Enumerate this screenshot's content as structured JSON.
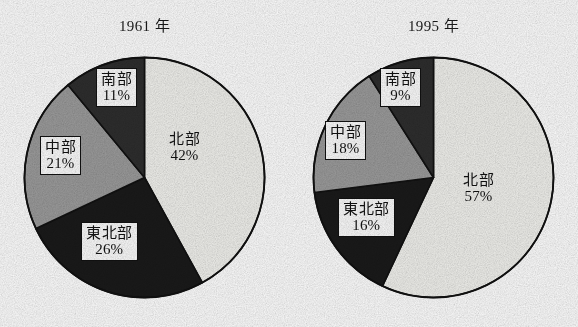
{
  "figure": {
    "background_color": "#ffffff",
    "outline_color": "#111111"
  },
  "palette": {
    "hokubu": "#f2f2ee",
    "tohokubu": "#1a1a1a",
    "chubu": "#9c9c9c",
    "nanbu": "#2e2e2e"
  },
  "charts": [
    {
      "title": "1961 年",
      "labels": {
        "hokubu": {
          "name": "北部",
          "pct": "42%",
          "boxed": false
        },
        "tohokubu": {
          "name": "東北部",
          "pct": "26%",
          "boxed": true
        },
        "chubu": {
          "name": "中部",
          "pct": "21%",
          "boxed": true
        },
        "nanbu": {
          "name": "南部",
          "pct": "11%",
          "boxed": true
        }
      }
    },
    {
      "title": "1995 年",
      "labels": {
        "hokubu": {
          "name": "北部",
          "pct": "57%",
          "boxed": false
        },
        "tohokubu": {
          "name": "東北部",
          "pct": "16%",
          "boxed": true
        },
        "chubu": {
          "name": "中部",
          "pct": "18%",
          "boxed": true
        },
        "nanbu": {
          "name": "南部",
          "pct": "9%",
          "boxed": true
        }
      }
    }
  ],
  "chart_data": [
    {
      "type": "pie",
      "title": "1961 年",
      "categories": [
        "北部",
        "東北部",
        "中部",
        "南部"
      ],
      "values": [
        42,
        26,
        21,
        11
      ],
      "value_unit": "%",
      "data_labels": [
        "42%",
        "26%",
        "21%",
        "11%"
      ],
      "colors": [
        "#f2f2ee",
        "#1a1a1a",
        "#9c9c9c",
        "#2e2e2e"
      ],
      "start_angle_deg": 0,
      "direction": "clockwise",
      "legend": "none",
      "labels_inside": true
    },
    {
      "type": "pie",
      "title": "1995 年",
      "categories": [
        "北部",
        "東北部",
        "中部",
        "南部"
      ],
      "values": [
        57,
        16,
        18,
        9
      ],
      "value_unit": "%",
      "data_labels": [
        "57%",
        "16%",
        "18%",
        "9%"
      ],
      "colors": [
        "#f2f2ee",
        "#1a1a1a",
        "#9c9c9c",
        "#2e2e2e"
      ],
      "start_angle_deg": 0,
      "direction": "clockwise",
      "legend": "none",
      "labels_inside": true
    }
  ]
}
